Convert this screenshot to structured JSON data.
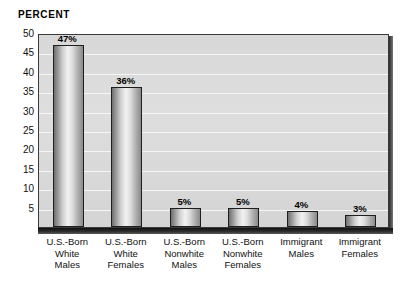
{
  "chart_data": {
    "type": "bar",
    "title": "",
    "ylabel": "PERCENT",
    "xlabel": "",
    "ylim": [
      0,
      50
    ],
    "ytick_values": [
      50,
      45,
      40,
      35,
      30,
      25,
      20,
      15,
      10,
      5
    ],
    "grid": true,
    "legend": "none",
    "categories": [
      "U.S.-Born White Males",
      "U.S.-Born White Females",
      "U.S.-Born Nonwhite Males",
      "U.S.-Born Nonwhite Females",
      "Immigrant Males",
      "Immigrant Females"
    ],
    "category_lines": [
      [
        "U.S.-Born",
        "White",
        "Males"
      ],
      [
        "U.S.-Born",
        "White",
        "Females"
      ],
      [
        "U.S.-Born",
        "Nonwhite",
        "Males"
      ],
      [
        "U.S.-Born",
        "Nonwhite",
        "Females"
      ],
      [
        "Immigrant",
        "Males"
      ],
      [
        "Immigrant",
        "Females"
      ]
    ],
    "values": [
      47,
      36,
      5,
      5,
      4,
      3
    ],
    "value_labels": [
      "47%",
      "36%",
      "5%",
      "5%",
      "4%",
      "3%"
    ],
    "colors": {
      "plot_background": "#d9d9d9",
      "gridline": "#f6f6f6",
      "frame": "#3a3a3a",
      "bar_outline": "#1e1e1e",
      "bar_light": "#f2f2f2",
      "bar_dark": "#6f6f6f",
      "text": "#111111",
      "base_shadow": "#1a1a1a"
    }
  },
  "axis": {
    "y_title": "PERCENT"
  },
  "ticks": {
    "y": [
      "50",
      "45",
      "40",
      "35",
      "30",
      "25",
      "20",
      "15",
      "10",
      "5"
    ]
  }
}
